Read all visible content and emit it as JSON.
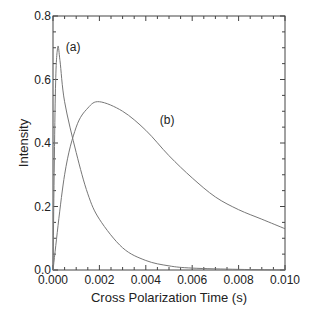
{
  "chart_data": {
    "type": "line",
    "title": "",
    "xlabel": "Cross Polarization Time (s)",
    "ylabel": "Intensity",
    "xlim": [
      0.0,
      0.01
    ],
    "ylim": [
      0.0,
      0.8
    ],
    "xticks": [
      "0.000",
      "0.002",
      "0.004",
      "0.006",
      "0.008",
      "0.010"
    ],
    "yticks": [
      "0.0",
      "0.2",
      "0.4",
      "0.6",
      "0.8"
    ],
    "grid": false,
    "legend": "none (curves labeled inline)",
    "series": [
      {
        "name": "(a)",
        "x": [
          0.0,
          0.0001,
          0.0002,
          0.0003,
          0.0005,
          0.001,
          0.0015,
          0.002,
          0.003,
          0.004,
          0.005,
          0.006,
          0.008,
          0.01
        ],
        "values": [
          0.0,
          0.55,
          0.7,
          0.66,
          0.53,
          0.37,
          0.24,
          0.16,
          0.07,
          0.03,
          0.013,
          0.006,
          0.002,
          0.0
        ]
      },
      {
        "name": "(b)",
        "x": [
          0.0,
          0.0005,
          0.001,
          0.0015,
          0.002,
          0.003,
          0.004,
          0.005,
          0.006,
          0.007,
          0.008,
          0.009,
          0.01
        ],
        "values": [
          0.0,
          0.3,
          0.45,
          0.51,
          0.53,
          0.5,
          0.44,
          0.36,
          0.29,
          0.23,
          0.19,
          0.16,
          0.13
        ]
      }
    ],
    "annotations": [
      {
        "text": "(a)",
        "x": 0.00055,
        "y": 0.69
      },
      {
        "text": "(b)",
        "x": 0.0046,
        "y": 0.46
      }
    ]
  }
}
